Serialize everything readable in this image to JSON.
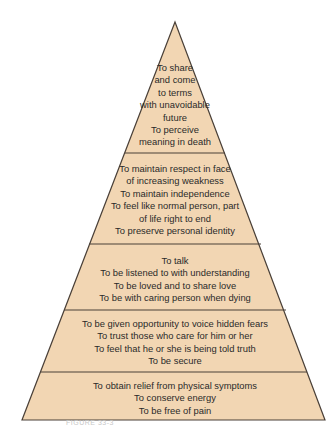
{
  "diagram": {
    "type": "pyramid",
    "fill_color": "#f2d6b3",
    "stroke_color": "#4a4038",
    "tiers": [
      {
        "level": 5,
        "position": "top",
        "lines": [
          "To share",
          "and come",
          "to terms",
          "with unavoidable",
          "future",
          "To perceive",
          "meaning in death"
        ]
      },
      {
        "level": 4,
        "lines": [
          "To maintain respect in face",
          "of increasing weakness",
          "To maintain independence",
          "To feel like normal person, part",
          "of life right to end",
          "To preserve personal identity"
        ]
      },
      {
        "level": 3,
        "lines": [
          "To talk",
          "To be listened to with understanding",
          "To be loved and to share love",
          "To be with caring person when dying"
        ]
      },
      {
        "level": 2,
        "lines": [
          "To be given opportunity to voice hidden fears",
          "To trust those who care for him or her",
          "To feel that he or she is being told truth",
          "To be secure"
        ]
      },
      {
        "level": 1,
        "position": "base",
        "lines": [
          "To obtain relief from physical symptoms",
          "To conserve energy",
          "To be free of pain"
        ]
      }
    ],
    "caption": "FIGURE 33-3"
  }
}
